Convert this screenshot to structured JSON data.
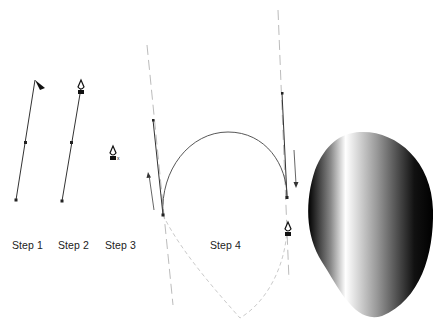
{
  "figure": {
    "steps": [
      {
        "label": "Step 1",
        "tool": "direct-selection-arrow"
      },
      {
        "label": "Step 2",
        "tool": "pen"
      },
      {
        "label": "Step 3",
        "tool": "pen-with-x"
      },
      {
        "label": "Step 4",
        "tool": "pen"
      }
    ],
    "result": {
      "shape": "teardrop-gradient-fill",
      "gradient": "black-white-black linear"
    }
  },
  "colors": {
    "path": "#333333",
    "guide": "#aaaaaa",
    "gradient_dark": "#000000",
    "gradient_light": "#ffffff"
  }
}
